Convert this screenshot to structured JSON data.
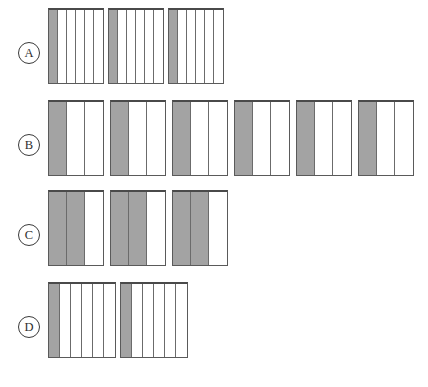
{
  "figure": {
    "background_color": "#ffffff",
    "fill_color": "#a3a3a3",
    "empty_color": "#ffffff",
    "line_color": "#5a5a5a",
    "top_rule_color": "#4a4a4a",
    "label_text_color": "#2e2e2e"
  },
  "rows": [
    {
      "label": "A",
      "label_name": "row-label-a",
      "top": 8,
      "group_count": 3,
      "stripes_per_group": 6,
      "filled_per_group": 1,
      "stripe_width": 9,
      "group_height": 76,
      "group_gap": 4
    },
    {
      "label": "B",
      "label_name": "row-label-b",
      "top": 100,
      "group_count": 6,
      "stripes_per_group": 3,
      "filled_per_group": 1,
      "stripe_width": 18,
      "group_height": 76,
      "group_gap": 6
    },
    {
      "label": "C",
      "label_name": "row-label-c",
      "top": 190,
      "group_count": 3,
      "stripes_per_group": 3,
      "filled_per_group": 2,
      "stripe_width": 18,
      "group_height": 76,
      "group_gap": 6
    },
    {
      "label": "D",
      "label_name": "row-label-d",
      "top": 282,
      "group_count": 2,
      "stripes_per_group": 6,
      "filled_per_group": 1,
      "stripe_width": 11,
      "group_height": 76,
      "group_gap": 4
    }
  ],
  "chart_data": {
    "type": "bar",
    "xlabel": "",
    "ylabel": "",
    "categories": [
      "A",
      "B",
      "C",
      "D"
    ],
    "series": [
      {
        "name": "groups",
        "values": [
          3,
          6,
          3,
          2
        ]
      },
      {
        "name": "stripes_per_group",
        "values": [
          6,
          3,
          3,
          6
        ]
      },
      {
        "name": "filled_per_group",
        "values": [
          1,
          1,
          2,
          1
        ]
      },
      {
        "name": "total_stripes",
        "values": [
          18,
          18,
          9,
          12
        ]
      },
      {
        "name": "total_filled",
        "values": [
          3,
          6,
          6,
          2
        ]
      }
    ],
    "fraction_shaded": [
      "1/6",
      "1/3",
      "2/3",
      "1/6"
    ],
    "grid": false,
    "legend": "none"
  }
}
